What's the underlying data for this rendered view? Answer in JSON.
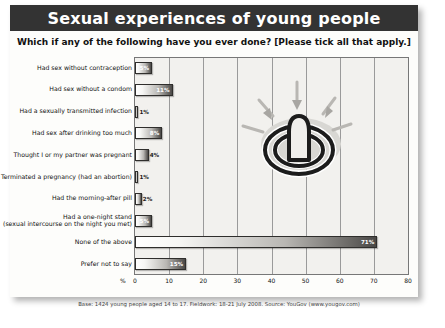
{
  "poster": {
    "title": "Sexual experiences of young people",
    "question": "Which if any of the following have you ever done? [Please tick all that apply.]",
    "source_note": "Base: 1424 young people aged 14 to 17. Fieldwork: 18-21 July 2008. Source: YouGov (www.yougov.com)",
    "watermark_name": "condom-power-symbol-watermark"
  },
  "axis": {
    "unit": "%",
    "ticks": [
      "0",
      "10",
      "20",
      "30",
      "40",
      "50",
      "60",
      "70",
      "80"
    ],
    "min": 0,
    "max": 80
  },
  "chart_data": {
    "type": "bar",
    "orientation": "horizontal",
    "title": "Sexual experiences of young people",
    "subtitle": "Which if any of the following have you ever done? [Please tick all that apply.]",
    "xlabel": "%",
    "ylabel": "",
    "xlim": [
      0,
      80
    ],
    "grid": true,
    "legend": false,
    "categories": [
      "Had sex without contraception",
      "Had sex without a condom",
      "Had a sexually transmitted infection",
      "Had sex after drinking too much",
      "Thought I or my partner was pregnant",
      "Terminated a pregnancy (had an abortion)",
      "Had the morning-after pill",
      "Had a one-night stand\n(sexual intercourse on the night you met)",
      "None of the above",
      "Prefer not to say"
    ],
    "values": [
      5,
      11,
      1,
      8,
      4,
      1,
      2,
      5,
      71,
      15
    ],
    "value_labels": [
      "5%",
      "11%",
      "1%",
      "8%",
      "4%",
      "1%",
      "2%",
      "5%",
      "71%",
      "15%"
    ],
    "source": "Base: 1424 young people aged 14 to 17. Fieldwork: 18-21 July 2008. Source: YouGov (www.yougov.com)"
  }
}
